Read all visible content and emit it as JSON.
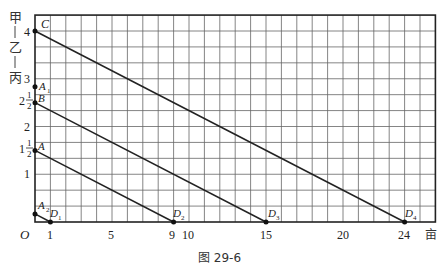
{
  "figure": {
    "caption": "图 29-6",
    "y_axis_label_chars": [
      "甲",
      "乙",
      "丙"
    ],
    "x_unit": "亩",
    "origin_label": "O",
    "x_ticks": [
      "1",
      "5",
      "9",
      "10",
      "15",
      "20",
      "24"
    ],
    "y_ticks": [
      "4",
      "3",
      "2",
      "1"
    ],
    "y_fraction_ticks": [
      {
        "whole": "2",
        "num": "1",
        "den": "2"
      },
      {
        "whole": "1",
        "num": "1",
        "den": "2"
      }
    ],
    "points": {
      "C": "C",
      "A1": "A",
      "A1_sub": "1",
      "B": "B",
      "A": "A",
      "A2": "A",
      "A2_sub": "2",
      "D1": "D",
      "D1_sub": "1",
      "D2": "D",
      "D2_sub": "2",
      "D3": "D",
      "D3_sub": "3",
      "D4": "D",
      "D4_sub": "4"
    }
  },
  "diagram": {
    "grid": {
      "x_units": 26,
      "x_step": 1,
      "y_rows": 13,
      "y_step": 0.3333
    },
    "lines": [
      {
        "from": "C",
        "from_xy": [
          0,
          4
        ],
        "to": "D4",
        "to_xy": [
          24,
          0
        ]
      },
      {
        "from": "B",
        "from_xy": [
          0,
          2.5
        ],
        "to": "D3",
        "to_xy": [
          15,
          0
        ]
      },
      {
        "from": "A",
        "from_xy": [
          0,
          1.5
        ],
        "to": "D2",
        "to_xy": [
          9,
          0
        ]
      },
      {
        "from": "A2",
        "from_xy": [
          0,
          0.17
        ],
        "to": "D1",
        "to_xy": [
          1,
          0
        ]
      }
    ],
    "extra_points": [
      {
        "name": "A1",
        "xy": [
          0,
          2.83
        ]
      }
    ]
  }
}
